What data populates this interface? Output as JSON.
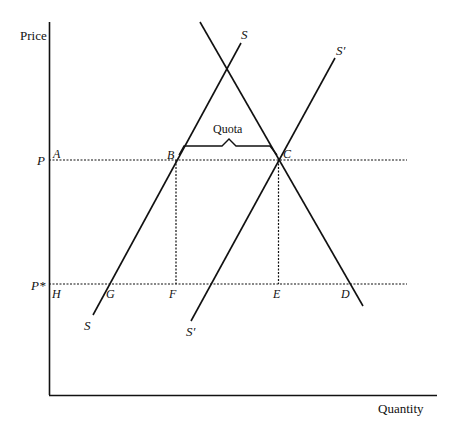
{
  "axes": {
    "y_label": "Price",
    "x_label": "Quantity"
  },
  "price_levels": {
    "p": "P",
    "p_star": "P*"
  },
  "curves": {
    "supply_label": "S",
    "supply_bottom_label": "S",
    "supply_shifted_label": "S′",
    "supply_shifted_bottom_label": "S′"
  },
  "points": {
    "A": "A",
    "B": "B",
    "C": "C",
    "D": "D",
    "E": "E",
    "F": "F",
    "G": "G",
    "H": "H"
  },
  "annotations": {
    "quota": "Quota"
  },
  "colors": {
    "line": "#111111",
    "background": "#ffffff"
  }
}
